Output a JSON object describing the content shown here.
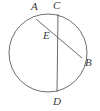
{
  "figure": {
    "type": "geometry-diagram",
    "background_color": "#ffffff",
    "stroke_color": "#6b6b6b",
    "label_color": "#3a3a3a",
    "stroke_width": 1,
    "width": 100,
    "height": 111
  },
  "circle": {
    "name": "main-circle",
    "cx": 48,
    "cy": 53,
    "r": 39
  },
  "segments": [
    {
      "name": "chord-ab",
      "from": "A",
      "to": "B",
      "x1": 36,
      "y1": 19,
      "x2": 82,
      "y2": 58
    },
    {
      "name": "chord-cd",
      "from": "C",
      "to": "D",
      "x1": 58,
      "y1": 14,
      "x2": 57,
      "y2": 92
    }
  ],
  "points": [
    {
      "id": "A",
      "label": "A",
      "x": 36,
      "y": 19,
      "label_x": 31,
      "label_y": 1,
      "on": "circle"
    },
    {
      "id": "C",
      "label": "C",
      "x": 58,
      "y": 14,
      "label_x": 53,
      "label_y": 0,
      "on": "circle"
    },
    {
      "id": "E",
      "label": "E",
      "x": 58,
      "y": 36,
      "label_x": 43,
      "label_y": 30,
      "on": "intersection"
    },
    {
      "id": "B",
      "label": "B",
      "x": 82,
      "y": 58,
      "label_x": 85,
      "label_y": 57,
      "on": "circle"
    },
    {
      "id": "D",
      "label": "D",
      "x": 57,
      "y": 92,
      "label_x": 53,
      "label_y": 96,
      "on": "circle"
    }
  ]
}
